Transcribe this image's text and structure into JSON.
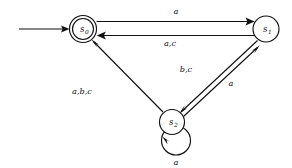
{
  "diagram": {
    "type": "finite-state-machine",
    "title": "",
    "states": [
      {
        "id": "s0",
        "label": "s",
        "subscript": "0",
        "accepting": true,
        "start": true,
        "cx": 83,
        "cy": 29,
        "r": 13.5
      },
      {
        "id": "s1",
        "label": "s",
        "subscript": "1",
        "accepting": false,
        "start": false,
        "cx": 266,
        "cy": 29,
        "r": 13.0
      },
      {
        "id": "s2",
        "label": "s",
        "subscript": "2",
        "accepting": false,
        "start": false,
        "cx": 172,
        "cy": 122,
        "r": 12.5
      }
    ],
    "transitions": [
      {
        "id": "t0",
        "from": "s0",
        "to": "s1",
        "label": "a",
        "label_x": 176,
        "label_y": 13
      },
      {
        "id": "t1",
        "from": "s1",
        "to": "s0",
        "label": "a,c",
        "label_x": 170,
        "label_y": 45
      },
      {
        "id": "t2",
        "from": "s1",
        "to": "s2",
        "label": "b,c",
        "label_x": 186,
        "label_y": 70
      },
      {
        "id": "t3",
        "from": "s2",
        "to": "s1",
        "label": "a",
        "label_x": 231,
        "label_y": 84
      },
      {
        "id": "t4",
        "from": "s2",
        "to": "s0",
        "label": "a,b,c",
        "label_x": 82,
        "label_y": 92
      },
      {
        "id": "t5",
        "from": "s2",
        "to": "s2",
        "label": "a",
        "label_x": 176,
        "label_y": 164
      }
    ],
    "start_arrow": {
      "id": "start",
      "from_x": 19,
      "to_x": 68,
      "y": 29
    },
    "colors": {
      "stroke": "#111111",
      "background": "#ffffff"
    }
  }
}
